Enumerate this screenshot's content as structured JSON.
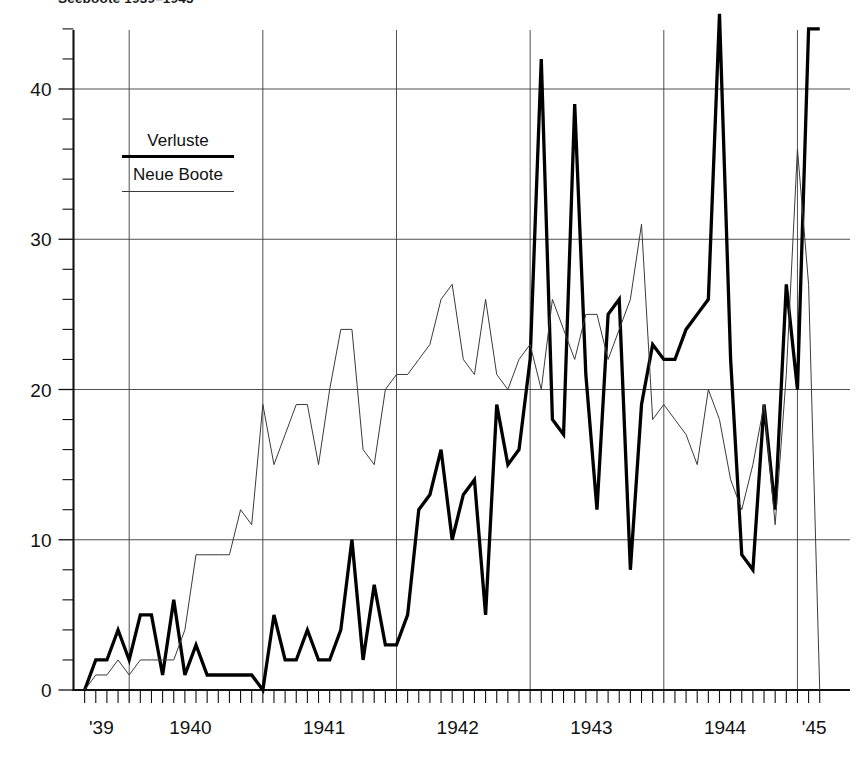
{
  "title": "Seeboote 1939–1945",
  "legend": {
    "position": "inside-top-left",
    "entries": [
      {
        "label": "Verluste",
        "style": "thick-line"
      },
      {
        "label": "Neue Boote",
        "style": "thin-line"
      }
    ]
  },
  "axes": {
    "y_ticks": [
      "0",
      "10",
      "20",
      "30",
      "40"
    ],
    "y_tick_values": [
      0,
      10,
      20,
      30,
      40
    ],
    "y_minor_step": 2,
    "x_ticks": [
      "'39",
      "1940",
      "1941",
      "1942",
      "1943",
      "1944",
      "'45"
    ],
    "x_tick_years": [
      1939,
      1940,
      1941,
      1942,
      1943,
      1944,
      1945
    ],
    "x_minor_label": "monthly"
  },
  "chart_data": {
    "type": "line",
    "title": "Seeboote 1939–1945",
    "xlabel": "",
    "ylabel": "",
    "ylim": [
      0,
      45
    ],
    "xlim": [
      "1939-09",
      "1945-03"
    ],
    "grid": true,
    "legend_position": "inside-top-left",
    "x": [
      "1939-09",
      "1939-10",
      "1939-11",
      "1939-12",
      "1940-01",
      "1940-02",
      "1940-03",
      "1940-04",
      "1940-05",
      "1940-06",
      "1940-07",
      "1940-08",
      "1940-09",
      "1940-10",
      "1940-11",
      "1940-12",
      "1941-01",
      "1941-02",
      "1941-03",
      "1941-04",
      "1941-05",
      "1941-06",
      "1941-07",
      "1941-08",
      "1941-09",
      "1941-10",
      "1941-11",
      "1941-12",
      "1942-01",
      "1942-02",
      "1942-03",
      "1942-04",
      "1942-05",
      "1942-06",
      "1942-07",
      "1942-08",
      "1942-09",
      "1942-10",
      "1942-11",
      "1942-12",
      "1943-01",
      "1943-02",
      "1943-03",
      "1943-04",
      "1943-05",
      "1943-06",
      "1943-07",
      "1943-08",
      "1943-09",
      "1943-10",
      "1943-11",
      "1943-12",
      "1944-01",
      "1944-02",
      "1944-03",
      "1944-04",
      "1944-05",
      "1944-06",
      "1944-07",
      "1944-08",
      "1944-09",
      "1944-10",
      "1944-11",
      "1944-12",
      "1945-01",
      "1945-02",
      "1945-03"
    ],
    "series": [
      {
        "name": "Verluste",
        "style": "thick-line",
        "color": "#000000",
        "values": [
          0,
          2,
          2,
          4,
          2,
          5,
          5,
          1,
          6,
          1,
          3,
          1,
          1,
          1,
          1,
          1,
          0,
          5,
          2,
          2,
          4,
          2,
          2,
          4,
          10,
          2,
          7,
          3,
          3,
          5,
          12,
          13,
          16,
          10,
          13,
          14,
          5,
          19,
          15,
          16,
          22,
          42,
          18,
          17,
          39,
          21,
          12,
          25,
          26,
          8,
          19,
          23,
          22,
          22,
          24,
          25,
          26,
          45,
          22,
          9,
          8,
          19,
          12,
          27,
          20,
          44,
          44
        ]
      },
      {
        "name": "Neue Boote",
        "style": "thin-line",
        "color": "#3a3a3a",
        "values": [
          0,
          1,
          1,
          2,
          1,
          2,
          2,
          2,
          2,
          4,
          9,
          9,
          9,
          9,
          12,
          11,
          19,
          15,
          17,
          19,
          19,
          15,
          20,
          24,
          24,
          16,
          15,
          20,
          21,
          21,
          22,
          23,
          26,
          27,
          22,
          21,
          26,
          21,
          20,
          22,
          23,
          20,
          26,
          24,
          22,
          25,
          25,
          22,
          24,
          26,
          31,
          18,
          19,
          18,
          17,
          15,
          20,
          18,
          14,
          12,
          15,
          19,
          11,
          21,
          36,
          27,
          0
        ]
      }
    ]
  }
}
